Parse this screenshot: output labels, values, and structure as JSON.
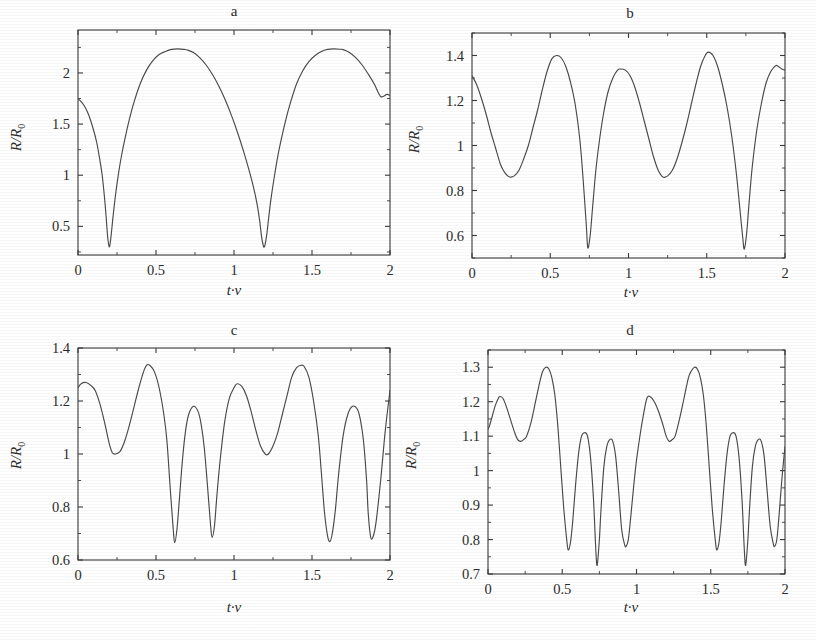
{
  "figure": {
    "background_color": "#ffffff",
    "line_color": "#4a4a4a",
    "text_color": "#2b2b2b",
    "panel_count": 4
  },
  "axis_titles": {
    "x": "t·ν",
    "y_main": "R/R",
    "y_sub": "0"
  },
  "panels": [
    {
      "label": "a",
      "x_ticks": [
        "0",
        "0.5",
        "1",
        "1.5",
        "2"
      ],
      "y_ticks": [
        "0.5",
        "1",
        "1.5",
        "2"
      ]
    },
    {
      "label": "b",
      "x_ticks": [
        "0",
        "0.5",
        "1",
        "1.5",
        "2"
      ],
      "y_ticks": [
        "0.6",
        "0.8",
        "1",
        "1.2",
        "1.4"
      ]
    },
    {
      "label": "c",
      "x_ticks": [
        "0",
        "0.5",
        "1",
        "1.5",
        "2"
      ],
      "y_ticks": [
        "0.6",
        "0.8",
        "1",
        "1.2",
        "1.4"
      ]
    },
    {
      "label": "d",
      "x_ticks": [
        "0",
        "0.5",
        "1",
        "1.5",
        "2"
      ],
      "y_ticks": [
        "0.7",
        "0.8",
        "0.9",
        "1",
        "1.1",
        "1.2",
        "1.3"
      ]
    }
  ],
  "chart_data": [
    {
      "type": "line",
      "title": "a",
      "xlabel": "t·ν",
      "ylabel": "R/R0",
      "xlim": [
        0,
        2
      ],
      "ylim": [
        0.22,
        2.42
      ],
      "x_ticks": [
        0,
        0.5,
        1,
        1.5,
        2
      ],
      "y_ticks": [
        0.5,
        1,
        1.5,
        2
      ],
      "grid": false,
      "legend": "none",
      "series": [
        {
          "name": "R/R0",
          "x": [
            0.0,
            0.02,
            0.04,
            0.06,
            0.08,
            0.1,
            0.12,
            0.14,
            0.155,
            0.17,
            0.18,
            0.19,
            0.2,
            0.21,
            0.225,
            0.24,
            0.26,
            0.28,
            0.3,
            0.33,
            0.36,
            0.4,
            0.44,
            0.48,
            0.52,
            0.56,
            0.6,
            0.64,
            0.68,
            0.7,
            0.74,
            0.78,
            0.82,
            0.86,
            0.9,
            0.94,
            0.98,
            1.02,
            1.06,
            1.1,
            1.13,
            1.15,
            1.165,
            1.175,
            1.185,
            1.195,
            1.21,
            1.225,
            1.24,
            1.26,
            1.28,
            1.3,
            1.33,
            1.36,
            1.4,
            1.44,
            1.48,
            1.52,
            1.56,
            1.6,
            1.64,
            1.68,
            1.7,
            1.74,
            1.78,
            1.82,
            1.86,
            1.9,
            1.94,
            1.98,
            2.0
          ],
          "y": [
            1.75,
            1.72,
            1.68,
            1.62,
            1.54,
            1.44,
            1.32,
            1.15,
            1.0,
            0.78,
            0.6,
            0.4,
            0.3,
            0.38,
            0.6,
            0.8,
            1.02,
            1.2,
            1.35,
            1.55,
            1.72,
            1.9,
            2.03,
            2.12,
            2.18,
            2.21,
            2.23,
            2.235,
            2.23,
            2.225,
            2.2,
            2.15,
            2.08,
            1.99,
            1.88,
            1.75,
            1.6,
            1.43,
            1.24,
            1.03,
            0.85,
            0.7,
            0.55,
            0.42,
            0.33,
            0.3,
            0.42,
            0.62,
            0.8,
            1.0,
            1.18,
            1.33,
            1.53,
            1.7,
            1.89,
            2.02,
            2.11,
            2.17,
            2.21,
            2.23,
            2.235,
            2.232,
            2.228,
            2.2,
            2.15,
            2.08,
            1.99,
            1.89,
            1.77,
            1.79,
            1.78
          ]
        }
      ]
    },
    {
      "type": "line",
      "title": "b",
      "xlabel": "t·ν",
      "ylabel": "R/R0",
      "xlim": [
        0,
        2
      ],
      "ylim": [
        0.5,
        1.5
      ],
      "x_ticks": [
        0,
        0.5,
        1,
        1.5,
        2
      ],
      "y_ticks": [
        0.6,
        0.8,
        1,
        1.2,
        1.4
      ],
      "grid": false,
      "legend": "none",
      "series": [
        {
          "name": "R/R0",
          "x": [
            0.0,
            0.03,
            0.06,
            0.09,
            0.12,
            0.15,
            0.18,
            0.2,
            0.22,
            0.24,
            0.27,
            0.3,
            0.33,
            0.36,
            0.39,
            0.42,
            0.45,
            0.48,
            0.51,
            0.54,
            0.57,
            0.6,
            0.63,
            0.66,
            0.69,
            0.71,
            0.73,
            0.74,
            0.755,
            0.77,
            0.79,
            0.81,
            0.84,
            0.87,
            0.9,
            0.93,
            0.95,
            0.98,
            1.01,
            1.04,
            1.07,
            1.1,
            1.13,
            1.16,
            1.19,
            1.22,
            1.25,
            1.28,
            1.31,
            1.34,
            1.37,
            1.4,
            1.43,
            1.46,
            1.49,
            1.51,
            1.54,
            1.57,
            1.6,
            1.63,
            1.66,
            1.69,
            1.71,
            1.73,
            1.74,
            1.755,
            1.77,
            1.79,
            1.82,
            1.85,
            1.88,
            1.91,
            1.94,
            1.96,
            1.98,
            2.0
          ],
          "y": [
            1.31,
            1.27,
            1.21,
            1.14,
            1.06,
            0.99,
            0.92,
            0.89,
            0.87,
            0.86,
            0.865,
            0.89,
            0.94,
            1.0,
            1.08,
            1.16,
            1.25,
            1.33,
            1.385,
            1.4,
            1.39,
            1.35,
            1.28,
            1.18,
            1.02,
            0.85,
            0.65,
            0.545,
            0.6,
            0.72,
            0.88,
            1.0,
            1.14,
            1.24,
            1.3,
            1.335,
            1.34,
            1.335,
            1.31,
            1.26,
            1.19,
            1.11,
            1.03,
            0.95,
            0.89,
            0.86,
            0.865,
            0.89,
            0.94,
            1.01,
            1.09,
            1.18,
            1.27,
            1.35,
            1.4,
            1.415,
            1.4,
            1.35,
            1.27,
            1.17,
            1.04,
            0.87,
            0.73,
            0.59,
            0.54,
            0.61,
            0.74,
            0.9,
            1.07,
            1.19,
            1.28,
            1.33,
            1.355,
            1.35,
            1.34,
            1.335
          ]
        }
      ]
    },
    {
      "type": "line",
      "title": "c",
      "xlabel": "t·ν",
      "ylabel": "R/R0",
      "xlim": [
        0,
        2
      ],
      "ylim": [
        0.6,
        1.4
      ],
      "x_ticks": [
        0,
        0.5,
        1,
        1.5,
        2
      ],
      "y_ticks": [
        0.6,
        0.8,
        1,
        1.2,
        1.4
      ],
      "grid": false,
      "legend": "none",
      "series": [
        {
          "name": "R/R0",
          "x": [
            0.0,
            0.02,
            0.05,
            0.08,
            0.11,
            0.14,
            0.17,
            0.2,
            0.22,
            0.24,
            0.27,
            0.3,
            0.33,
            0.36,
            0.39,
            0.42,
            0.44,
            0.46,
            0.49,
            0.52,
            0.55,
            0.57,
            0.59,
            0.61,
            0.62,
            0.635,
            0.65,
            0.67,
            0.69,
            0.71,
            0.74,
            0.77,
            0.79,
            0.81,
            0.83,
            0.85,
            0.86,
            0.875,
            0.89,
            0.91,
            0.94,
            0.97,
            1.0,
            1.02,
            1.05,
            1.08,
            1.11,
            1.14,
            1.17,
            1.2,
            1.22,
            1.25,
            1.28,
            1.31,
            1.34,
            1.37,
            1.4,
            1.43,
            1.45,
            1.48,
            1.51,
            1.54,
            1.56,
            1.58,
            1.6,
            1.615,
            1.63,
            1.65,
            1.67,
            1.7,
            1.73,
            1.76,
            1.79,
            1.81,
            1.83,
            1.85,
            1.86,
            1.875,
            1.89,
            1.91,
            1.94,
            1.97,
            2.0
          ],
          "y": [
            1.25,
            1.265,
            1.27,
            1.26,
            1.24,
            1.19,
            1.12,
            1.04,
            1.005,
            1.0,
            1.01,
            1.05,
            1.11,
            1.18,
            1.25,
            1.31,
            1.335,
            1.335,
            1.31,
            1.25,
            1.15,
            1.05,
            0.88,
            0.72,
            0.665,
            0.72,
            0.83,
            0.98,
            1.09,
            1.15,
            1.18,
            1.16,
            1.11,
            1.02,
            0.88,
            0.73,
            0.685,
            0.73,
            0.84,
            0.97,
            1.12,
            1.21,
            1.25,
            1.265,
            1.255,
            1.22,
            1.16,
            1.09,
            1.03,
            1.0,
            1.0,
            1.03,
            1.08,
            1.15,
            1.22,
            1.29,
            1.325,
            1.335,
            1.33,
            1.29,
            1.2,
            1.07,
            0.93,
            0.78,
            0.69,
            0.67,
            0.7,
            0.79,
            0.92,
            1.07,
            1.15,
            1.18,
            1.17,
            1.13,
            1.05,
            0.9,
            0.78,
            0.69,
            0.685,
            0.74,
            0.9,
            1.09,
            1.24
          ]
        }
      ]
    },
    {
      "type": "line",
      "title": "d",
      "xlabel": "t·ν",
      "ylabel": "R/R0",
      "xlim": [
        0,
        2
      ],
      "ylim": [
        0.7,
        1.35
      ],
      "x_ticks": [
        0,
        0.5,
        1,
        1.5,
        2
      ],
      "y_ticks": [
        0.7,
        0.8,
        0.9,
        1,
        1.1,
        1.2,
        1.3
      ],
      "grid": false,
      "legend": "none",
      "series": [
        {
          "name": "R/R0",
          "x": [
            0.0,
            0.01,
            0.03,
            0.05,
            0.07,
            0.08,
            0.1,
            0.12,
            0.15,
            0.18,
            0.2,
            0.22,
            0.24,
            0.26,
            0.29,
            0.32,
            0.35,
            0.37,
            0.39,
            0.41,
            0.43,
            0.45,
            0.47,
            0.49,
            0.51,
            0.53,
            0.54,
            0.555,
            0.57,
            0.59,
            0.61,
            0.63,
            0.65,
            0.67,
            0.69,
            0.71,
            0.725,
            0.735,
            0.75,
            0.76,
            0.78,
            0.8,
            0.82,
            0.84,
            0.86,
            0.88,
            0.9,
            0.92,
            0.93,
            0.945,
            0.96,
            0.98,
            1.0,
            1.03,
            1.05,
            1.07,
            1.09,
            1.12,
            1.15,
            1.18,
            1.2,
            1.22,
            1.24,
            1.26,
            1.29,
            1.32,
            1.35,
            1.37,
            1.39,
            1.41,
            1.43,
            1.45,
            1.47,
            1.49,
            1.51,
            1.53,
            1.54,
            1.555,
            1.57,
            1.59,
            1.61,
            1.63,
            1.65,
            1.67,
            1.69,
            1.71,
            1.725,
            1.735,
            1.75,
            1.76,
            1.78,
            1.8,
            1.82,
            1.84,
            1.86,
            1.88,
            1.9,
            1.92,
            1.93,
            1.945,
            1.96,
            1.98,
            2.0
          ],
          "y": [
            1.12,
            1.13,
            1.16,
            1.19,
            1.21,
            1.215,
            1.21,
            1.19,
            1.15,
            1.11,
            1.09,
            1.085,
            1.09,
            1.1,
            1.14,
            1.2,
            1.26,
            1.29,
            1.3,
            1.295,
            1.27,
            1.22,
            1.13,
            1.01,
            0.89,
            0.8,
            0.77,
            0.79,
            0.85,
            0.96,
            1.05,
            1.1,
            1.11,
            1.1,
            1.04,
            0.92,
            0.78,
            0.725,
            0.8,
            0.88,
            1.01,
            1.07,
            1.09,
            1.085,
            1.04,
            0.94,
            0.83,
            0.785,
            0.78,
            0.8,
            0.86,
            0.95,
            1.03,
            1.12,
            1.17,
            1.21,
            1.215,
            1.2,
            1.17,
            1.13,
            1.1,
            1.085,
            1.09,
            1.1,
            1.15,
            1.21,
            1.27,
            1.29,
            1.3,
            1.295,
            1.27,
            1.22,
            1.13,
            1.01,
            0.89,
            0.8,
            0.77,
            0.79,
            0.85,
            0.96,
            1.05,
            1.1,
            1.11,
            1.1,
            1.04,
            0.92,
            0.78,
            0.725,
            0.8,
            0.88,
            1.01,
            1.07,
            1.09,
            1.085,
            1.04,
            0.94,
            0.84,
            0.79,
            0.78,
            0.8,
            0.87,
            0.98,
            1.07
          ]
        }
      ]
    }
  ]
}
